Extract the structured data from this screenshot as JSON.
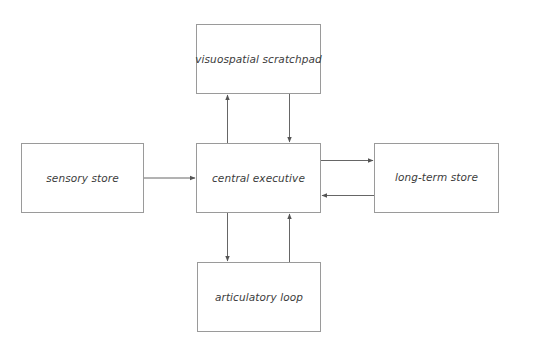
{
  "diagram": {
    "type": "block-flow",
    "nodes": [
      {
        "id": "visuospatial",
        "label": "visuospatial scratchpad"
      },
      {
        "id": "sensory",
        "label": "sensory store"
      },
      {
        "id": "central",
        "label": "central executive"
      },
      {
        "id": "longterm",
        "label": "long-term store"
      },
      {
        "id": "articulatory",
        "label": "articulatory loop"
      }
    ],
    "edges": [
      {
        "from": "sensory",
        "to": "central"
      },
      {
        "from": "central",
        "to": "visuospatial"
      },
      {
        "from": "visuospatial",
        "to": "central"
      },
      {
        "from": "central",
        "to": "longterm"
      },
      {
        "from": "longterm",
        "to": "central"
      },
      {
        "from": "central",
        "to": "articulatory"
      },
      {
        "from": "articulatory",
        "to": "central"
      }
    ],
    "colors": {
      "box_border": "#9a9a9a",
      "arrow": "#555555",
      "text": "#3c3c3c",
      "background": "#ffffff"
    }
  }
}
